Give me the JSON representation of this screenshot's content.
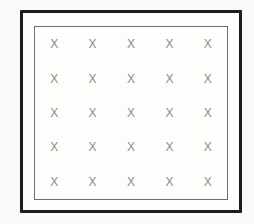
{
  "figure": {
    "grid": {
      "rows": 5,
      "cols": 5,
      "symbol": "X"
    },
    "colors": {
      "outer_border": "#1d1d1d",
      "inner_border": "#6e6e6e",
      "mark": "#8c8c8c",
      "background": "#faf9f7",
      "panel": "#fdfdfc"
    }
  }
}
